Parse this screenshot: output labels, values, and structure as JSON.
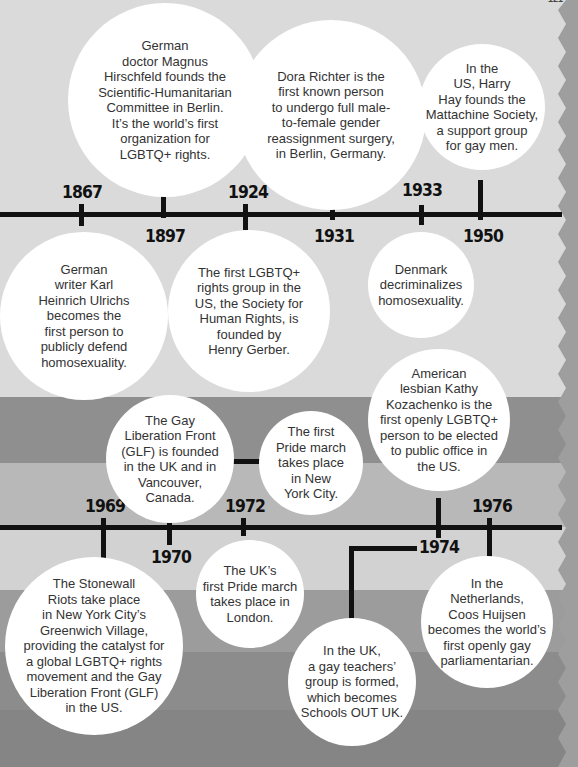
{
  "page": {
    "number": "121"
  },
  "colors": {
    "top_background": "#dadada",
    "edge": "#9e9e9e",
    "bands": [
      "#8f8f8f",
      "#b8b8b8",
      "#d2d2d2",
      "#9c9c9c",
      "#8c8c8c",
      "#858585"
    ],
    "line": "#111111",
    "bubble": "#ffffff",
    "text": "#333333"
  },
  "timeline_top": {
    "years": [
      "1867",
      "1897",
      "1924",
      "1931",
      "1933",
      "1950"
    ],
    "events": [
      {
        "year": "1867",
        "text": "German\nwriter Karl\nHeinrich Ulrichs\nbecomes the\nfirst person to\npublicly defend\nhomosexuality."
      },
      {
        "year": "1897",
        "text": "German\ndoctor Magnus\nHirschfeld founds the\nScientific-Humanitarian\nCommittee in Berlin.\nIt’s the world’s first\norganization for\nLGBTQ+ rights."
      },
      {
        "year": "1924",
        "text": "The first LGBTQ+\nrights group in the\nUS, the Society for\nHuman Rights, is\nfounded by\nHenry Gerber."
      },
      {
        "year": "1931",
        "text": "Dora Richter is the\nfirst known person\nto undergo full male-\nto-female gender\nreassignment surgery,\nin Berlin, Germany."
      },
      {
        "year": "1933",
        "text": "Denmark\ndecriminalizes\nhomosexuality."
      },
      {
        "year": "1950",
        "text": "In the\nUS, Harry\nHay founds the\nMattachine Society,\na support group\nfor gay men."
      }
    ]
  },
  "timeline_bottom": {
    "years": [
      "1969",
      "1970",
      "1972",
      "1974",
      "1976"
    ],
    "events": [
      {
        "year": "1969",
        "text": "The Stonewall\nRiots take place\nin New York City’s\nGreenwich Village,\nproviding the catalyst for\na global LGBTQ+ rights\nmovement and the Gay\nLiberation Front (GLF)\nin the US."
      },
      {
        "year": "1970",
        "text": "The Gay\nLiberation Front\n(GLF) is founded\nin the UK and in\nVancouver,\nCanada."
      },
      {
        "year": "1970",
        "text": "The first\nPride march\ntakes place\nin New\nYork City."
      },
      {
        "year": "1972",
        "text": "The UK’s\nfirst Pride march\ntakes place in\nLondon."
      },
      {
        "year": "1974",
        "text": "American\nlesbian Kathy\nKozachenko is the\nfirst openly LGBTQ+\nperson to be elected\nto public office in\nthe US."
      },
      {
        "year": "1974",
        "text": "In the UK,\na gay teachers’\ngroup is formed,\nwhich becomes\nSchools OUT UK."
      },
      {
        "year": "1976",
        "text": "In the\nNetherlands,\nCoos Huijsen\nbecomes the world’s\nfirst openly gay\nparliamentarian."
      }
    ]
  }
}
